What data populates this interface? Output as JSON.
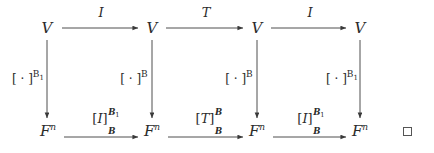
{
  "diagram": {
    "type": "commutative-diagram",
    "rows": {
      "top": {
        "nodes": [
          {
            "id": "v-top-1",
            "label": "V",
            "x": 47,
            "y": 28
          },
          {
            "id": "v-top-2",
            "label": "V",
            "x": 152,
            "y": 28
          },
          {
            "id": "v-top-3",
            "label": "V",
            "x": 257,
            "y": 28
          },
          {
            "id": "v-top-4",
            "label": "V",
            "x": 360,
            "y": 28
          }
        ]
      },
      "bottom": {
        "nodes": [
          {
            "id": "fn-bot-1",
            "base": "F",
            "sup": "n",
            "x": 48,
            "y": 131
          },
          {
            "id": "fn-bot-2",
            "base": "F",
            "sup": "n",
            "x": 152,
            "y": 131
          },
          {
            "id": "fn-bot-3",
            "base": "F",
            "sup": "n",
            "x": 257,
            "y": 131
          },
          {
            "id": "fn-bot-4",
            "base": "F",
            "sup": "n",
            "x": 360,
            "y": 131
          }
        ]
      }
    },
    "top_arrows": [
      {
        "id": "top-arrow-1",
        "label": "I",
        "x1": 62,
        "x2": 140,
        "y": 28,
        "label_x": 101,
        "label_y": 12
      },
      {
        "id": "top-arrow-2",
        "label": "T",
        "x1": 166,
        "x2": 245,
        "y": 28,
        "label_x": 206,
        "label_y": 12
      },
      {
        "id": "top-arrow-3",
        "label": "I",
        "x1": 271,
        "x2": 348,
        "y": 28,
        "label_x": 310,
        "label_y": 12
      }
    ],
    "bottom_arrows": [
      {
        "id": "bottom-arrow-1",
        "map": "I",
        "sup": "B",
        "sup_sub": "1",
        "sub": "B",
        "x1": 64,
        "x2": 140,
        "y": 137,
        "label_x": 100,
        "label_y": 118
      },
      {
        "id": "bottom-arrow-2",
        "map": "T",
        "sup": "B",
        "sup_sub": "",
        "sub": "B",
        "x1": 168,
        "x2": 245,
        "y": 137,
        "label_x": 205,
        "label_y": 118
      },
      {
        "id": "bottom-arrow-3",
        "map": "I",
        "sup": "B",
        "sup_sub": "1",
        "sub": "B",
        "x1": 273,
        "x2": 348,
        "y": 137,
        "label_x": 305,
        "label_y": 118
      }
    ],
    "vertical_arrows": [
      {
        "id": "vert-arrow-1",
        "x": 47,
        "y1": 40,
        "y2": 120,
        "label_bracket": "[ · ]",
        "label_sup": "B",
        "label_sup_sub": "1",
        "label_x": 28,
        "label_y": 78
      },
      {
        "id": "vert-arrow-2",
        "x": 152,
        "y1": 40,
        "y2": 120,
        "label_bracket": "[ · ]",
        "label_sup": "B",
        "label_sup_sub": "",
        "label_x": 134,
        "label_y": 78
      },
      {
        "id": "vert-arrow-3",
        "x": 257,
        "y1": 40,
        "y2": 120,
        "label_bracket": "[ · ]",
        "label_sup": "B",
        "label_sup_sub": "",
        "label_x": 239,
        "label_y": 78
      },
      {
        "id": "vert-arrow-4",
        "x": 360,
        "y1": 40,
        "y2": 120,
        "label_bracket": "[ · ]",
        "label_sup": "B",
        "label_sup_sub": "1",
        "label_x": 342,
        "label_y": 78
      }
    ],
    "qed": {
      "symbol": "square",
      "x": 407,
      "y": 131
    },
    "colors": {
      "background": "#ffffff",
      "ink": "#2b2b2b",
      "line": "#3a3a3a",
      "qed_border": "#555555"
    }
  }
}
